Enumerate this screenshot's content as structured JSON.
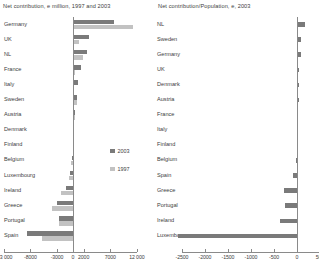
{
  "chart_data": [
    {
      "id": "left",
      "type": "bar",
      "orientation": "horizontal",
      "title": "Net contribution, e million, 1997 and 2003",
      "xlabel": "",
      "ylabel": "",
      "xlim": [
        -13000,
        12000
      ],
      "grid": false,
      "legend_position": "center-right",
      "ticks": [
        -13000,
        -8000,
        -3000,
        0,
        2000,
        7000,
        12000
      ],
      "tick_labels": [
        "-13 000",
        "-8000",
        "-3000",
        "0",
        "2000",
        "7000",
        "12 000"
      ],
      "categories": [
        "Germany",
        "UK",
        "NL",
        "France",
        "Italy",
        "Sweden",
        "Austria",
        "Denmark",
        "Finland",
        "Belgium",
        "Luxembourg",
        "Ireland",
        "Greece",
        "Portugal",
        "Spain"
      ],
      "series": [
        {
          "name": "2003",
          "color": "#7a7a7a",
          "values": [
            7700,
            3000,
            2600,
            1500,
            850,
            800,
            400,
            250,
            120,
            -200,
            -500,
            -1400,
            -3100,
            -2700,
            -8600
          ]
        },
        {
          "name": "1997",
          "color": "#c2c2c2",
          "values": [
            11200,
            1100,
            1800,
            400,
            200,
            750,
            330,
            160,
            90,
            -400,
            -700,
            -2200,
            -4000,
            -2600,
            -5900
          ]
        }
      ]
    },
    {
      "id": "right",
      "type": "bar",
      "orientation": "horizontal",
      "title": "Net contribution/Population, e, 2003",
      "xlabel": "",
      "ylabel": "",
      "xlim": [
        -2700,
        500
      ],
      "grid": false,
      "legend_position": "none",
      "ticks": [
        -2500,
        -2000,
        -1500,
        -1000,
        -500,
        0,
        500
      ],
      "tick_labels": [
        "-2500",
        "-2000",
        "-1500",
        "-1000",
        "-500",
        "0",
        "500"
      ],
      "categories": [
        "NL",
        "Sweden",
        "Germany",
        "UK",
        "Denmark",
        "Austria",
        "France",
        "Italy",
        "Finland",
        "Belgium",
        "Spain",
        "Greece",
        "Portugal",
        "Ireland",
        "Luxembourg"
      ],
      "series": [
        {
          "name": "2003",
          "color": "#7a7a7a",
          "values": [
            170,
            95,
            93,
            52,
            48,
            46,
            26,
            16,
            24,
            -22,
            -95,
            -285,
            -265,
            -360,
            -2580
          ]
        }
      ]
    }
  ],
  "legend": {
    "items": [
      {
        "label": "2003",
        "color": "#7a7a7a"
      },
      {
        "label": "1997",
        "color": "#c2c2c2"
      }
    ]
  },
  "colors": {
    "series_2003": "#7a7a7a",
    "series_1997": "#c2c2c2",
    "axis": "#8a8a8a",
    "text": "#3d3d3d",
    "background": "#ffffff"
  }
}
